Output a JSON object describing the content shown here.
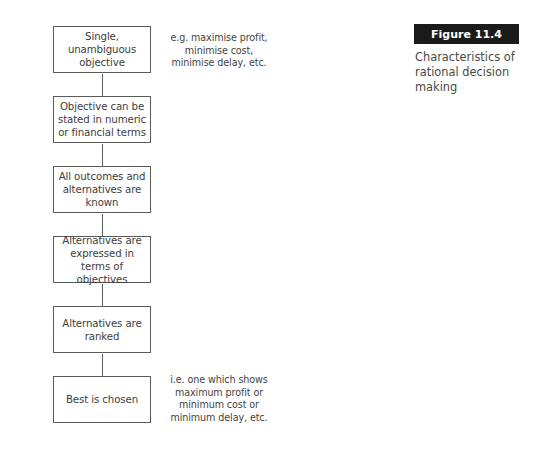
{
  "figure": {
    "label": "Figure 11.4",
    "caption": "Characteristics of rational decision making"
  },
  "flowchart": {
    "steps": [
      {
        "text": "Single, unambiguous objective"
      },
      {
        "text": "Objective can be stated in numeric or financial terms"
      },
      {
        "text": "All outcomes and alternatives are known"
      },
      {
        "text": "Alternatives are expressed in terms of objectives"
      },
      {
        "text": "Alternatives are ranked"
      },
      {
        "text": "Best is chosen"
      }
    ],
    "notes": {
      "top": "e.g. maximise profit, minimise cost, minimise delay, etc.",
      "bottom": "i.e. one which shows maximum profit or minimum cost or minimum delay, etc."
    }
  },
  "colors": {
    "label_background": "#1a1a1a",
    "border": "#5a5a5a"
  }
}
